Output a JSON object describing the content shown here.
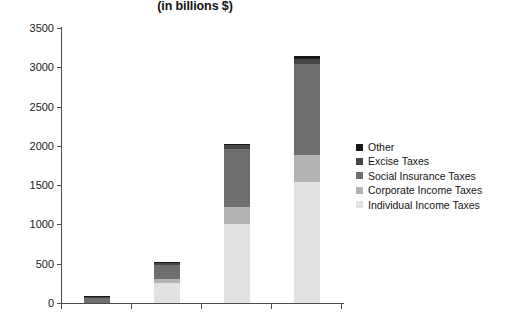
{
  "chart_data": {
    "type": "bar",
    "subtype": "stacked-bar",
    "title": "(in billions $)",
    "subtitle": "",
    "xlabel": "",
    "ylabel": "",
    "ylim": [
      0,
      3500
    ],
    "ytick_labels": [
      "0",
      "500",
      "1000",
      "1500",
      "2000",
      "2500",
      "3000",
      "3500"
    ],
    "ytick_values": [
      0,
      500,
      1000,
      1500,
      2000,
      2500,
      3000,
      3500
    ],
    "grid": false,
    "legend_position": "right",
    "categories": [
      "",
      "",
      "",
      ""
    ],
    "xtick_labels": [
      "",
      "",
      "",
      "",
      ""
    ],
    "series": [
      {
        "name": "Individual Income Taxes",
        "color": "#e2e2e2",
        "values": [
          0,
          250,
          1000,
          1540
        ]
      },
      {
        "name": "Corporate Income Taxes",
        "color": "#b3b3b3",
        "values": [
          0,
          55,
          220,
          350
        ]
      },
      {
        "name": "Social Insurance Taxes",
        "color": "#6e6e6e",
        "values": [
          60,
          175,
          740,
          1150
        ]
      },
      {
        "name": "Excise Taxes",
        "color": "#464646",
        "values": [
          25,
          35,
          50,
          70
        ]
      },
      {
        "name": "Other",
        "color": "#181818",
        "values": [
          5,
          5,
          15,
          40
        ]
      }
    ],
    "totals": [
      90,
      520,
      2025,
      3150
    ]
  },
  "legend": {
    "items": [
      {
        "label": "Other",
        "color": "#181818"
      },
      {
        "label": "Excise Taxes",
        "color": "#464646"
      },
      {
        "label": "Social Insurance Taxes",
        "color": "#6e6e6e"
      },
      {
        "label": "Corporate Income Taxes",
        "color": "#b3b3b3"
      },
      {
        "label": "Individual Income Taxes",
        "color": "#e2e2e2"
      }
    ]
  },
  "axis": {
    "axis_color": "#4d4d4d",
    "tick_color": "#4d4d4d"
  }
}
